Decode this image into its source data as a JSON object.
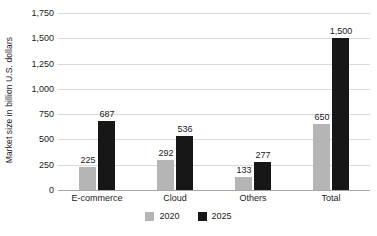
{
  "chart_data": {
    "type": "bar",
    "title": "",
    "subtitle": "",
    "xlabel": "",
    "ylabel": "Market size in billion U.S. dollars",
    "categories": [
      "E-commerce",
      "Cloud",
      "Others",
      "Total"
    ],
    "series": [
      {
        "name": "2020",
        "color": "#b5b5b5",
        "values": [
          225,
          292,
          133,
          650
        ],
        "labels": [
          "225",
          "292",
          "133",
          "650"
        ]
      },
      {
        "name": "2025",
        "color": "#171717",
        "values": [
          687,
          536,
          277,
          1500
        ],
        "labels": [
          "687",
          "536",
          "277",
          "1,500"
        ]
      }
    ],
    "ylim": [
      0,
      1750
    ],
    "ytick_values": [
      0,
      250,
      500,
      750,
      1000,
      1250,
      1500,
      1750
    ],
    "ytick_labels": [
      "0",
      "250",
      "500",
      "750",
      "1,000",
      "1,250",
      "1,500",
      "1,750"
    ],
    "grid": true,
    "legend_position": "bottom",
    "legend_entries": [
      "2020",
      "2025"
    ],
    "colors": {
      "series_2020": "#b5b5b5",
      "series_2025": "#171717",
      "gridline": "#d9d9d9",
      "axis": "#a6a6a6",
      "text": "#1a1a1a",
      "background": "#ffffff"
    }
  }
}
